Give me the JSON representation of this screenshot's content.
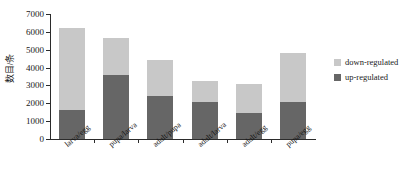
{
  "chart_data": {
    "type": "bar",
    "stacked": true,
    "title": "",
    "xlabel": "",
    "ylabel": "数目/条",
    "ylim": [
      0,
      7000
    ],
    "ytick_step": 1000,
    "yticks": [
      0,
      1000,
      2000,
      3000,
      4000,
      5000,
      6000,
      7000
    ],
    "grid": false,
    "legend_position": "right",
    "categories": [
      "larva/egg",
      "pupa/larva",
      "adult/pupa",
      "adult/larva",
      "adult/egg",
      "pupa/egg"
    ],
    "series": [
      {
        "name": "up-regulated",
        "color": "#666666",
        "values": [
          1650,
          3600,
          2400,
          2100,
          1450,
          2050
        ]
      },
      {
        "name": "down-regulated",
        "color": "#c8c8c8",
        "values": [
          4550,
          2050,
          2000,
          1150,
          1650,
          2750
        ]
      }
    ],
    "totals": [
      6200,
      5650,
      4400,
      3250,
      3100,
      4800
    ]
  },
  "legend": {
    "items": [
      {
        "label": "down-regulated",
        "color": "#c8c8c8"
      },
      {
        "label": "up-regulated",
        "color": "#666666"
      }
    ]
  }
}
